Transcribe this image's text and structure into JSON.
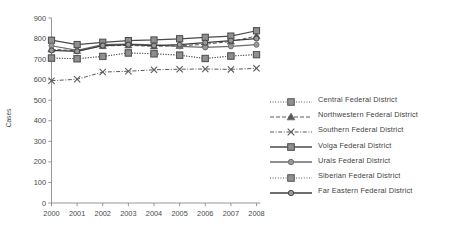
{
  "chart_data": {
    "type": "line",
    "title": "",
    "xlabel": "",
    "ylabel": "Cases",
    "x": [
      2000,
      2001,
      2002,
      2003,
      2004,
      2005,
      2006,
      2007,
      2008
    ],
    "categories": [
      "2000",
      "2001",
      "2002",
      "2003",
      "2004",
      "2005",
      "2006",
      "2007",
      "2008"
    ],
    "ylim": [
      0,
      900
    ],
    "yticks": [
      0,
      100,
      200,
      300,
      400,
      500,
      600,
      700,
      800,
      900
    ],
    "ytick_labels": [
      "0",
      "100",
      "200",
      "300",
      "400",
      "500",
      "600",
      "700",
      "800",
      "900"
    ],
    "grid": false,
    "legend_position": "right",
    "series": [
      {
        "name": "Central Federal District",
        "marker": "square",
        "line_style": "dotted",
        "color": "#5a5a5a",
        "values": [
          705,
          702,
          713,
          730,
          726,
          719,
          703,
          715,
          722
        ]
      },
      {
        "name": "Northwestern Federal District",
        "marker": "triangle",
        "line_style": "dashed",
        "color": "#5a5a5a",
        "values": [
          748,
          740,
          764,
          767,
          762,
          765,
          772,
          786,
          812
        ]
      },
      {
        "name": "Southern Federal District",
        "marker": "x",
        "line_style": "dashdot",
        "color": "#5a5a5a",
        "values": [
          595,
          602,
          637,
          641,
          648,
          651,
          652,
          650,
          655
        ]
      },
      {
        "name": "Volga Federal District",
        "marker": "square",
        "line_style": "solid",
        "color": "#4a4a4a",
        "values": [
          792,
          771,
          782,
          790,
          793,
          799,
          806,
          812,
          838
        ]
      },
      {
        "name": "Urals Federal District",
        "marker": "circle",
        "line_style": "solid",
        "color": "#6a6a6a",
        "values": [
          765,
          742,
          770,
          773,
          769,
          762,
          757,
          762,
          770
        ]
      },
      {
        "name": "Siberian Federal District",
        "marker": "square",
        "line_style": "dotted",
        "color": "#5a5a5a",
        "values": [
          705,
          702,
          713,
          730,
          726,
          719,
          703,
          715,
          722
        ]
      },
      {
        "name": "Far Eastern Federal District",
        "marker": "circle",
        "line_style": "solid",
        "color": "#3c3c3c",
        "values": [
          742,
          738,
          766,
          770,
          766,
          770,
          780,
          790,
          800
        ]
      }
    ]
  },
  "legend": {
    "items": [
      {
        "label": "Central Federal District"
      },
      {
        "label": "Northwestern Federal District"
      },
      {
        "label": "Southern Federal District"
      },
      {
        "label": "Volga Federal District"
      },
      {
        "label": "Urals Federal District"
      },
      {
        "label": "Siberian Federal District"
      },
      {
        "label": "Far Eastern Federal District"
      }
    ]
  },
  "axes": {
    "y_title": "Cases"
  }
}
